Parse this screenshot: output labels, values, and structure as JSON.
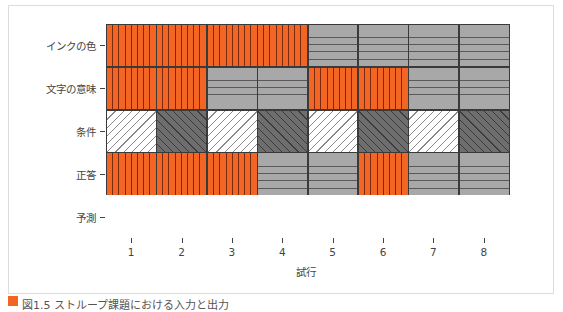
{
  "chart_data": {
    "type": "heatmap",
    "title": "",
    "xlabel": "試行",
    "ylabel": "",
    "x": [
      1,
      2,
      3,
      4,
      5,
      6,
      7,
      8
    ],
    "rows": [
      "インクの色",
      "文字の意味",
      "条件",
      "正答",
      "予測"
    ],
    "patterns": {
      "A": {
        "name": "orange-vertical",
        "fill": "#f26522",
        "hatch": "vertical"
      },
      "B": {
        "name": "gray-horizontal",
        "fill": "#a8a8a8",
        "hatch": "horizontal"
      },
      "C": {
        "name": "white-diagonal",
        "fill": "#ffffff",
        "hatch": "diag-forward"
      },
      "D": {
        "name": "darkgray-diagonal",
        "fill": "#6e6e6e",
        "hatch": "diag-back"
      },
      "E": {
        "name": "empty",
        "fill": "#ffffff",
        "hatch": "none"
      }
    },
    "grid": [
      [
        "A",
        "A",
        "A",
        "A",
        "B",
        "B",
        "B",
        "B"
      ],
      [
        "A",
        "A",
        "B",
        "B",
        "A",
        "A",
        "B",
        "B"
      ],
      [
        "C",
        "D",
        "C",
        "D",
        "C",
        "D",
        "C",
        "D"
      ],
      [
        "A",
        "A",
        "A",
        "B",
        "B",
        "A",
        "B",
        "B"
      ],
      [
        "E",
        "E",
        "E",
        "E",
        "E",
        "E",
        "E",
        "E"
      ]
    ],
    "grid_on": true,
    "legend": "none"
  },
  "caption": {
    "text": "図1.5 ストループ課題における入力と出力"
  }
}
